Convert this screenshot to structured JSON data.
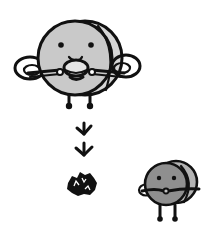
{
  "illustration": {
    "description": "Hand-drawn sequence: a large ringed planet bites its ring, arrows point down to a pile of crumbs, and a smaller planet with a thin ring remains",
    "colors": {
      "ink": "#111111",
      "big_planet_fill": "#c9c9c9",
      "big_planet_back": "#d6d6d6",
      "small_planet_fill": "#8f8f8f",
      "small_planet_back": "#b3b3b3",
      "background": "#ffffff"
    },
    "elements": [
      {
        "name": "big-planet",
        "state": "eating ring"
      },
      {
        "name": "arrow",
        "direction": "down"
      },
      {
        "name": "arrow",
        "direction": "down"
      },
      {
        "name": "crumbs",
        "state": "pile"
      },
      {
        "name": "small-planet",
        "state": "thin ring"
      }
    ]
  }
}
